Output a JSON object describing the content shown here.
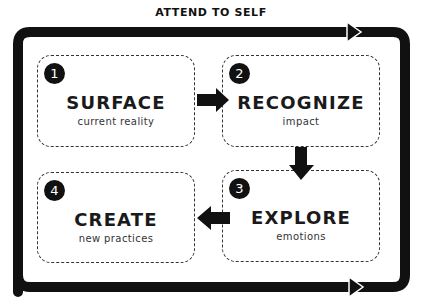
{
  "diagram": {
    "loop_label": "ATTEND TO SELF",
    "steps": [
      {
        "number": "1",
        "title": "SURFACE",
        "subtitle": "current reality"
      },
      {
        "number": "2",
        "title": "RECOGNIZE",
        "subtitle": "impact"
      },
      {
        "number": "3",
        "title": "EXPLORE",
        "subtitle": "emotions"
      },
      {
        "number": "4",
        "title": "CREATE",
        "subtitle": "new practices"
      }
    ],
    "flow": [
      "1 → 2",
      "2 → 3",
      "3 → 4"
    ],
    "colors": {
      "stroke": "#111111",
      "background": "#ffffff",
      "dashed_border": "#333333"
    }
  }
}
